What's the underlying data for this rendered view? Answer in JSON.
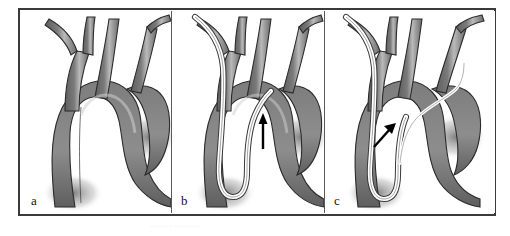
{
  "figure": {
    "style": "grayscale medical line illustration",
    "panel_count": 3,
    "frame_color": "#3a3a3a",
    "background_color": "#ffffff",
    "vessel_fill_dark": "#6e6e6e",
    "vessel_fill_mid": "#7c7c7c",
    "vessel_highlight": "#c9c9c9",
    "vessel_outline": "#2b2b2b",
    "catheter_color": "#ffffff",
    "catheter_outline": "#3a3a3a",
    "arrow_color": "#000000",
    "caption_ghost": "........ ........."
  },
  "panels": [
    {
      "label": "a",
      "name": "panel-a",
      "description": "Aortic arch with great vessels, no catheter",
      "has_catheter": false,
      "has_arrow": false,
      "structures": [
        "brachiocephalic trunk",
        "right subclavian artery",
        "right common carotid artery",
        "left common carotid artery",
        "left subclavian artery",
        "aortic arch",
        "ascending aorta",
        "descending aorta"
      ]
    },
    {
      "label": "b",
      "name": "panel-b",
      "description": "Catheter looped in descending aorta, tip directed toward arch",
      "has_catheter": true,
      "has_arrow": true,
      "arrow_direction": "up",
      "catheter_path": "right subclavian to descending aorta with U-turn loop, tip at left common carotid origin",
      "structures": [
        "brachiocephalic trunk",
        "right subclavian artery",
        "right common carotid artery",
        "left common carotid artery",
        "left subclavian artery",
        "aortic arch",
        "ascending aorta",
        "descending aorta",
        "catheter loop"
      ]
    },
    {
      "label": "c",
      "name": "panel-c",
      "description": "Guidewire advanced across aortic arch into left subclavian artery",
      "has_catheter": true,
      "has_arrow": true,
      "arrow_direction": "up-right",
      "catheter_path": "right subclavian to descending aorta loop, guidewire crosses arch into left subclavian artery",
      "structures": [
        "brachiocephalic trunk",
        "right subclavian artery",
        "right common carotid artery",
        "left common carotid artery",
        "left subclavian artery",
        "aortic arch",
        "ascending aorta",
        "descending aorta",
        "catheter loop",
        "guidewire across arch"
      ]
    }
  ]
}
